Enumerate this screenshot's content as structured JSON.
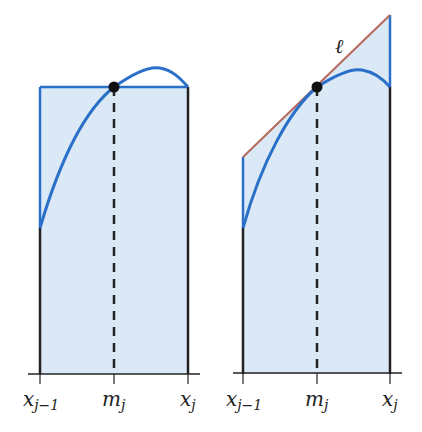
{
  "colors": {
    "fill": "#dbe8f5",
    "curve": "#2a70c8",
    "edge": "#2a70c8",
    "tangent": "#b5695a",
    "axis": "#222222",
    "dot": "#111111"
  },
  "left_panel": {
    "labels": {
      "x_left": {
        "base": "x",
        "sub": "j−1"
      },
      "mid": {
        "base": "m",
        "sub": "j"
      },
      "x_right": {
        "base": "x",
        "sub": "j"
      }
    }
  },
  "right_panel": {
    "tangent_label": "ℓ",
    "labels": {
      "x_left": {
        "base": "x",
        "sub": "j−1"
      },
      "mid": {
        "base": "m",
        "sub": "j"
      },
      "x_right": {
        "base": "x",
        "sub": "j"
      }
    }
  }
}
